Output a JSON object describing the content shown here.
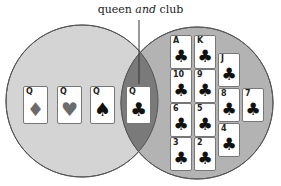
{
  "label": {
    "prefix": "queen ",
    "emphasis": "and",
    "suffix": " club"
  },
  "colors": {
    "left_circle": "#d4d4d4",
    "right_circle": "#b3b3b3",
    "intersection": "#7a7a7a",
    "stroke": "#555555",
    "red_suit": "#6b6b6b",
    "black_suit": "#111111"
  },
  "left_set": {
    "cards": [
      {
        "rank": "Q",
        "suit": "♦",
        "color": "#6b6b6b"
      },
      {
        "rank": "Q",
        "suit": "♥",
        "color": "#6b6b6b"
      },
      {
        "rank": "Q",
        "suit": "♠",
        "color": "#111111"
      }
    ]
  },
  "intersection": {
    "cards": [
      {
        "rank": "Q",
        "suit": "♣",
        "color": "#111111"
      }
    ]
  },
  "right_set": {
    "cards": [
      {
        "rank": "A",
        "suit": "♣"
      },
      {
        "rank": "K",
        "suit": "♣"
      },
      {
        "rank": "J",
        "suit": "♣"
      },
      {
        "rank": "10",
        "suit": "♣"
      },
      {
        "rank": "9",
        "suit": "♣"
      },
      {
        "rank": "8",
        "suit": "♣"
      },
      {
        "rank": "7",
        "suit": "♣"
      },
      {
        "rank": "6",
        "suit": "♣"
      },
      {
        "rank": "5",
        "suit": "♣"
      },
      {
        "rank": "4",
        "suit": "♣"
      },
      {
        "rank": "3",
        "suit": "♣"
      },
      {
        "rank": "2",
        "suit": "♣"
      }
    ]
  }
}
